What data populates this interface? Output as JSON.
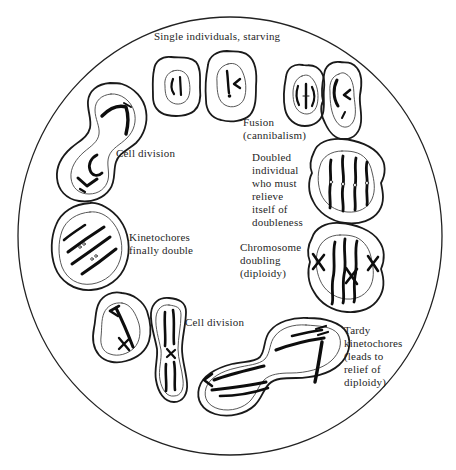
{
  "figure": {
    "background": "#ffffff",
    "ink_color": "#1c1c1c",
    "labels": {
      "single_individuals": "Single individuals, starving",
      "cell_division_left": "Cell division",
      "fusion": "Fusion\n(cannibalism)",
      "doubled_individual": "Doubled\nindividual\nwho must\nrelieve\nitself of\ndoubleness",
      "chromosome_doubling": "Chromosome\ndoubling\n(diploidy)",
      "kinetochores_double": "Kinetochores\nfinally double",
      "cell_division_bottom": "Cell division",
      "tardy_kinetochores": "Tardy\nkinetochores\n(leads to\nrelief of\ndiploidy)"
    },
    "cells": [
      "single-individual-cell-1",
      "single-individual-cell-2",
      "fusion-pair-cells",
      "doubled-individual-cell",
      "chromosome-doubling-cell",
      "tardy-kinetochores-dividing-cell",
      "bottom-dividing-cell-pair",
      "kinetochores-finally-double-cell",
      "upper-left-dividing-cell"
    ]
  }
}
